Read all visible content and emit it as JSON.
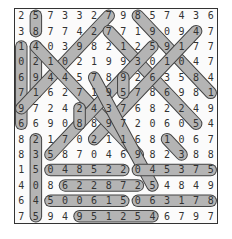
{
  "puzzle": {
    "title": "",
    "rows": 14,
    "cols": 14,
    "grid": [
      [
        "2",
        "5",
        "7",
        "3",
        "3",
        "2",
        "7",
        "9",
        "8",
        "5",
        "7",
        "4",
        "3",
        "6"
      ],
      [
        "3",
        "8",
        "7",
        "7",
        "4",
        "2",
        "7",
        "7",
        "1",
        "9",
        "0",
        "9",
        "4",
        "7"
      ],
      [
        "1",
        "4",
        "0",
        "3",
        "9",
        "8",
        "2",
        "1",
        "2",
        "5",
        "9",
        "1",
        "7",
        "7"
      ],
      [
        "0",
        "2",
        "1",
        "0",
        "2",
        "1",
        "9",
        "9",
        "3",
        "0",
        "1",
        "0",
        "4",
        "7"
      ],
      [
        "6",
        "9",
        "4",
        "4",
        "5",
        "7",
        "8",
        "9",
        "2",
        "6",
        "3",
        "5",
        "8",
        "4"
      ],
      [
        "7",
        "1",
        "6",
        "2",
        "7",
        "1",
        "9",
        "5",
        "7",
        "8",
        "6",
        "9",
        "8",
        "1"
      ],
      [
        "9",
        "7",
        "2",
        "4",
        "2",
        "4",
        "3",
        "7",
        "6",
        "8",
        "2",
        "2",
        "4",
        "9"
      ],
      [
        "6",
        "6",
        "9",
        "0",
        "8",
        "8",
        "9",
        "7",
        "2",
        "0",
        "6",
        "0",
        "5",
        "4"
      ],
      [
        "8",
        "2",
        "1",
        "7",
        "0",
        "2",
        "1",
        "1",
        "6",
        "8",
        "1",
        "0",
        "6",
        "7"
      ],
      [
        "8",
        "3",
        "5",
        "8",
        "7",
        "0",
        "4",
        "6",
        "9",
        "8",
        "2",
        "3",
        "8",
        "8"
      ],
      [
        "1",
        "5",
        "0",
        "4",
        "8",
        "5",
        "2",
        "2",
        "0",
        "4",
        "5",
        "3",
        "7",
        "5"
      ],
      [
        "4",
        "0",
        "8",
        "6",
        "2",
        "2",
        "8",
        "7",
        "2",
        "5",
        "4",
        "8",
        "4",
        "9"
      ],
      [
        "6",
        "4",
        "5",
        "0",
        "0",
        "6",
        "1",
        "5",
        "0",
        "6",
        "3",
        "1",
        "7",
        "8"
      ],
      [
        "7",
        "5",
        "9",
        "4",
        "9",
        "5",
        "1",
        "2",
        "5",
        "4",
        "6",
        "7",
        "9",
        "7"
      ]
    ],
    "found_words": [
      {
        "cells": [
          [
            0,
            1
          ],
          [
            1,
            1
          ]
        ]
      },
      {
        "cells": [
          [
            2,
            0
          ],
          [
            7,
            0
          ]
        ]
      },
      {
        "cells": [
          [
            2,
            1
          ],
          [
            5,
            1
          ]
        ]
      },
      {
        "cells": [
          [
            8,
            1
          ],
          [
            13,
            1
          ]
        ]
      },
      {
        "cells": [
          [
            0,
            6
          ],
          [
            6,
            0
          ]
        ]
      },
      {
        "cells": [
          [
            1,
            6
          ],
          [
            7,
            12
          ]
        ]
      },
      {
        "cells": [
          [
            0,
            8
          ],
          [
            5,
            13
          ]
        ]
      },
      {
        "cells": [
          [
            1,
            12
          ],
          [
            8,
            5
          ]
        ]
      },
      {
        "cells": [
          [
            2,
            1
          ],
          [
            9,
            8
          ]
        ]
      },
      {
        "cells": [
          [
            9,
            2
          ],
          [
            2,
            9
          ]
        ]
      },
      {
        "cells": [
          [
            4,
            5
          ],
          [
            11,
            9
          ]
        ]
      },
      {
        "cells": [
          [
            4,
            7
          ],
          [
            5,
            7
          ]
        ]
      },
      {
        "cells": [
          [
            6,
            4
          ],
          [
            7,
            4
          ]
        ]
      },
      {
        "cells": [
          [
            10,
            2
          ],
          [
            10,
            7
          ]
        ]
      },
      {
        "cells": [
          [
            10,
            8
          ],
          [
            10,
            13
          ]
        ]
      },
      {
        "cells": [
          [
            11,
            3
          ],
          [
            11,
            8
          ]
        ]
      },
      {
        "cells": [
          [
            12,
            2
          ],
          [
            12,
            7
          ]
        ]
      },
      {
        "cells": [
          [
            12,
            8
          ],
          [
            12,
            13
          ]
        ]
      },
      {
        "cells": [
          [
            13,
            4
          ],
          [
            13,
            9
          ]
        ]
      },
      {
        "cells": [
          [
            8,
            10
          ],
          [
            9,
            11
          ]
        ]
      }
    ],
    "colors": {
      "highlight_fill": "#c8c8c8",
      "highlight_stroke": "#444444",
      "text": "#333333",
      "border": "#333333"
    }
  }
}
